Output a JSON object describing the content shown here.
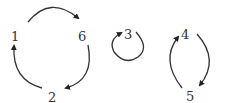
{
  "diagram": {
    "type": "permutation-cycles",
    "nodes": [
      {
        "id": "1",
        "label": "1",
        "x": 15,
        "y": 37
      },
      {
        "id": "6",
        "label": "6",
        "x": 82,
        "y": 37
      },
      {
        "id": "2",
        "label": "2",
        "x": 52,
        "y": 97
      },
      {
        "id": "3",
        "label": "3",
        "x": 127,
        "y": 35
      },
      {
        "id": "4",
        "label": "4",
        "x": 185,
        "y": 35
      },
      {
        "id": "5",
        "label": "5",
        "x": 190,
        "y": 96
      }
    ],
    "edges": [
      {
        "from": "1",
        "to": "6"
      },
      {
        "from": "6",
        "to": "2"
      },
      {
        "from": "2",
        "to": "1"
      },
      {
        "from": "3",
        "to": "3"
      },
      {
        "from": "4",
        "to": "5"
      },
      {
        "from": "5",
        "to": "4"
      }
    ],
    "cycles": [
      [
        "1",
        "6",
        "2"
      ],
      [
        "3"
      ],
      [
        "4",
        "5"
      ]
    ],
    "stroke_color": "#333333"
  }
}
